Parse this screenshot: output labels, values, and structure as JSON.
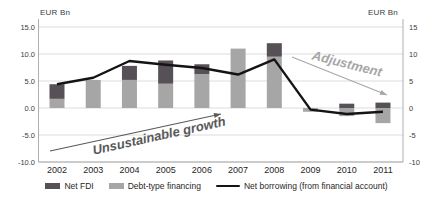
{
  "figure": {
    "left_axis_unit": "EUR Bn",
    "right_axis_unit": "EUR Bn"
  },
  "chart_data": {
    "type": "bar+line",
    "title": "",
    "categories": [
      "2002",
      "2003",
      "2004",
      "2005",
      "2006",
      "2007",
      "2008",
      "2009",
      "2010",
      "2011"
    ],
    "series": [
      {
        "name": "Net FDI",
        "type": "bar",
        "color": "#575057",
        "values": [
          2.7,
          0,
          2.6,
          4.3,
          1.8,
          0,
          2.5,
          0,
          0.8,
          1.0
        ]
      },
      {
        "name": "Debt-type financing",
        "type": "bar",
        "color": "#a6a6a6",
        "values": [
          1.7,
          5.2,
          5.2,
          4.5,
          6.3,
          11.0,
          9.5,
          -0.7,
          -1.5,
          -2.8
        ]
      },
      {
        "name": "Net borrowing (from financial account)",
        "type": "line",
        "color": "#141414",
        "values": [
          4.4,
          5.6,
          8.7,
          8.0,
          7.4,
          6.2,
          9.0,
          -0.3,
          -1.1,
          -0.7
        ]
      }
    ],
    "stacked": true,
    "ylim": [
      -10,
      15
    ],
    "ytick_step": 5,
    "left_ticks": [
      "15.0",
      "10.0",
      "5.0",
      "0.0",
      "-5.0",
      "-10.0"
    ],
    "right_ticks": [
      "15",
      "10",
      "5",
      "0",
      "-5",
      "-10"
    ],
    "grid": true,
    "legend_position": "bottom",
    "xlabel": "",
    "ylabel": "EUR Bn",
    "annotations": [
      {
        "id": "unsustainable-growth",
        "text": "Unsustainable growth",
        "color": "#595959",
        "rotation_deg": -12.5,
        "x": 160,
        "y": 140,
        "font_size": 13,
        "arrow": {
          "x1": 50,
          "y1": 151,
          "x2": 221,
          "y2": 114
        }
      },
      {
        "id": "adjustment",
        "text": "Adjustment",
        "color": "#a6a6a6",
        "rotation_deg": 14,
        "x": 346,
        "y": 68,
        "font_size": 13,
        "arrow": {
          "x1": 292,
          "y1": 57,
          "x2": 387,
          "y2": 95
        }
      }
    ]
  }
}
